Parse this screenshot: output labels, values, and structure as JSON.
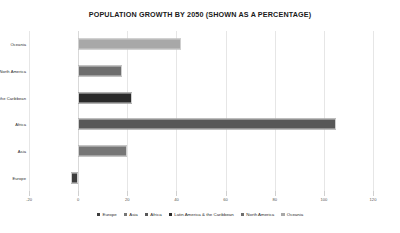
{
  "chart_data": {
    "type": "bar",
    "orientation": "horizontal",
    "title": "POPULATION GROWTH BY 2050 (SHOWN AS A PERCENTAGE)",
    "xlabel": "",
    "ylabel": "",
    "xlim": [
      -20,
      120
    ],
    "xticks": [
      -20,
      0,
      20,
      40,
      60,
      80,
      100,
      120
    ],
    "xtick_labels": [
      "-20",
      "0",
      "20",
      "40",
      "60",
      "80",
      "100",
      "120"
    ],
    "grid": true,
    "legend_position": "bottom",
    "categories": [
      "Oceania",
      "North America",
      "Latin America & the Caribbean",
      "Africa",
      "Asia",
      "Europe"
    ],
    "values": [
      42,
      18,
      22,
      105,
      20,
      -3
    ],
    "bar_colors": [
      "#a8a8a8",
      "#6e6e6e",
      "#2b2b2b",
      "#585858",
      "#767676",
      "#3d3d3d"
    ],
    "legend": [
      {
        "label": "Europe",
        "color": "#3d3d3d"
      },
      {
        "label": "Asia",
        "color": "#767676"
      },
      {
        "label": "Africa",
        "color": "#585858"
      },
      {
        "label": "Latin America & the Caribbean",
        "color": "#2b2b2b"
      },
      {
        "label": "North America",
        "color": "#6e6e6e"
      },
      {
        "label": "Oceania",
        "color": "#a8a8a8"
      }
    ]
  }
}
